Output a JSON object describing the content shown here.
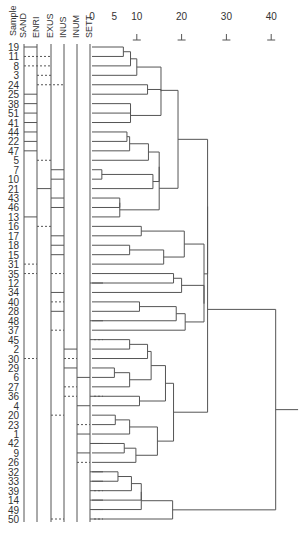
{
  "chart_data": {
    "type": "dendrogram",
    "title": "",
    "column_headers": [
      "Sample",
      "SAND",
      "ENRI",
      "EXUS",
      "INUS",
      "INUM",
      "SETT"
    ],
    "axis": {
      "ticks": [
        0,
        5,
        10,
        20,
        30,
        40
      ],
      "marked_ticks": [
        10,
        20,
        30,
        40
      ],
      "range": [
        0,
        45
      ]
    },
    "leaves": [
      "19",
      "11",
      "8",
      "3",
      "24",
      "25",
      "38",
      "51",
      "41",
      "44",
      "22",
      "47",
      "5",
      "7",
      "10",
      "21",
      "43",
      "46",
      "13",
      "16",
      "17",
      "18",
      "15",
      "31",
      "35",
      "12",
      "34",
      "40",
      "28",
      "48",
      "37",
      "45",
      "2",
      "30",
      "29",
      "6",
      "27",
      "36",
      "4",
      "20",
      "23",
      "1",
      "42",
      "9",
      "26",
      "32",
      "33",
      "39",
      "14",
      "49",
      "50"
    ],
    "merges": [
      {
        "a": "L0",
        "b": "L1",
        "h": 7.0,
        "id": "m0"
      },
      {
        "a": "m0",
        "b": "L2",
        "h": 8.6,
        "id": "m1"
      },
      {
        "a": "m1",
        "b": "L3",
        "h": 10.0,
        "id": "m2"
      },
      {
        "a": "L4",
        "b": "L5",
        "h": 12.4,
        "id": "m3"
      },
      {
        "a": "L6",
        "b": "L7",
        "h": 8.6,
        "id": "m4"
      },
      {
        "a": "m4",
        "b": "L8",
        "h": 8.6,
        "id": "m5"
      },
      {
        "a": "m2",
        "b": "m5",
        "h": 15.4,
        "id": "m6_pre"
      },
      {
        "a": "m6_pre",
        "b": "m3",
        "h": 15.4,
        "id": "m6"
      },
      {
        "a": "L9",
        "b": "L10",
        "h": 7.8,
        "id": "m7"
      },
      {
        "a": "m7",
        "b": "L11",
        "h": 8.4,
        "id": "m8"
      },
      {
        "a": "m8",
        "b": "L12",
        "h": 12.6,
        "id": "m9"
      },
      {
        "a": "L13",
        "b": "L14",
        "h": 2.2,
        "id": "m10"
      },
      {
        "a": "m10",
        "b": "L15",
        "h": 13.6,
        "id": "m11"
      },
      {
        "a": "m11",
        "b": "m9",
        "h": 15.0,
        "id": "m12"
      },
      {
        "a": "L16",
        "b": "L17",
        "h": 6.2,
        "id": "m13"
      },
      {
        "a": "m13",
        "b": "L18",
        "h": 6.2,
        "id": "m14"
      },
      {
        "a": "m12",
        "b": "m14",
        "h": 15.0,
        "id": "m15"
      },
      {
        "a": "m6",
        "b": "m15",
        "h": 19.2,
        "id": "m16"
      },
      {
        "a": "L19",
        "b": "L20",
        "h": 11.0,
        "id": "m17"
      },
      {
        "a": "L21",
        "b": "L22",
        "h": 8.4,
        "id": "m18"
      },
      {
        "a": "m18",
        "b": "L23",
        "h": 16.0,
        "id": "m19"
      },
      {
        "a": "m17",
        "b": "m19",
        "h": 20.6,
        "id": "m20"
      },
      {
        "a": "L24",
        "b": "L25",
        "h": 18.2,
        "id": "m21"
      },
      {
        "a": "m21",
        "b": "L26",
        "h": 20.0,
        "id": "m22"
      },
      {
        "a": "L27",
        "b": "L28",
        "h": 10.6,
        "id": "m23"
      },
      {
        "a": "m23",
        "b": "L29",
        "h": 18.8,
        "id": "m24"
      },
      {
        "a": "m24",
        "b": "L30",
        "h": 20.8,
        "id": "m25"
      },
      {
        "a": "m22",
        "b": "m25",
        "h": 25.0,
        "id": "m26"
      },
      {
        "a": "m20",
        "b": "m26",
        "h": 25.0,
        "id": "m27"
      },
      {
        "a": "m16",
        "b": "m27",
        "h": 25.8,
        "id": "m28"
      },
      {
        "a": "L31",
        "b": "L32",
        "h": 8.4,
        "id": "m29"
      },
      {
        "a": "m29",
        "b": "L33",
        "h": 12.4,
        "id": "m30"
      },
      {
        "a": "L34",
        "b": "L35",
        "h": 5.0,
        "id": "m31"
      },
      {
        "a": "m31",
        "b": "L36",
        "h": 8.4,
        "id": "m32"
      },
      {
        "a": "m30",
        "b": "m32",
        "h": 13.2,
        "id": "m33"
      },
      {
        "a": "L37",
        "b": "L38",
        "h": 10.6,
        "id": "m34"
      },
      {
        "a": "m33",
        "b": "m34",
        "h": 16.4,
        "id": "m35"
      },
      {
        "a": "L39",
        "b": "L40",
        "h": 5.2,
        "id": "m36"
      },
      {
        "a": "m36",
        "b": "L41",
        "h": 8.4,
        "id": "m37"
      },
      {
        "a": "L42",
        "b": "L43",
        "h": 7.2,
        "id": "m38"
      },
      {
        "a": "m38",
        "b": "L44",
        "h": 9.8,
        "id": "m39"
      },
      {
        "a": "m37",
        "b": "m39",
        "h": 14.6,
        "id": "m40"
      },
      {
        "a": "m35",
        "b": "m40",
        "h": 18.2,
        "id": "m41"
      },
      {
        "a": "m41",
        "b": "m28",
        "h": 25.8,
        "id": "m42_pre"
      },
      {
        "a": "L45",
        "b": "L46",
        "h": 5.8,
        "id": "m43"
      },
      {
        "a": "m43",
        "b": "L47",
        "h": 8.8,
        "id": "m44"
      },
      {
        "a": "m44",
        "b": "L48",
        "h": 11.0,
        "id": "m45"
      },
      {
        "a": "m45",
        "b": "L49",
        "h": 11.0,
        "id": "m46"
      },
      {
        "a": "m46",
        "b": "L50",
        "h": 18.0,
        "id": "m47"
      },
      {
        "a": "m42_pre",
        "b": "m47",
        "h": 41.0,
        "id": "root"
      }
    ],
    "root_tail_to": 46.0,
    "bars": [
      {
        "row": 0,
        "col": 0,
        "style": "solid"
      },
      {
        "row": 1,
        "col": 0,
        "style": "dash",
        "to": 2
      },
      {
        "row": 2,
        "col": 0,
        "style": "dash",
        "to": 2
      },
      {
        "row": 3,
        "col": 1,
        "style": "dash",
        "to": 2
      },
      {
        "row": 4,
        "col": 1,
        "style": "dash",
        "to": 3
      },
      {
        "row": 5,
        "col": 0,
        "style": "solid"
      },
      {
        "row": 6,
        "col": 0,
        "style": "solid"
      },
      {
        "row": 7,
        "col": 0,
        "style": "solid"
      },
      {
        "row": 8,
        "col": 0,
        "style": "solid"
      },
      {
        "row": 9,
        "col": 0,
        "style": "solid"
      },
      {
        "row": 10,
        "col": 0,
        "style": "solid"
      },
      {
        "row": 11,
        "col": 0,
        "style": "solid"
      },
      {
        "row": 12,
        "col": 1,
        "style": "dash",
        "to": 2
      },
      {
        "row": 13,
        "col": 2,
        "style": "solid"
      },
      {
        "row": 14,
        "col": 2,
        "style": "solid"
      },
      {
        "row": 15,
        "col": 1,
        "style": "solid"
      },
      {
        "row": 16,
        "col": 2,
        "style": "solid"
      },
      {
        "row": 17,
        "col": 2,
        "style": "solid"
      },
      {
        "row": 18,
        "col": 0,
        "style": "solid"
      },
      {
        "row": 19,
        "col": 1,
        "style": "dash",
        "to": 2
      },
      {
        "row": 20,
        "col": 2,
        "style": "solid"
      },
      {
        "row": 21,
        "col": 2,
        "style": "solid"
      },
      {
        "row": 22,
        "col": 2,
        "style": "solid"
      },
      {
        "row": 23,
        "col": 0,
        "style": "dash",
        "to": 1
      },
      {
        "row": 24,
        "col": 0,
        "style": "dash",
        "to": 1
      },
      {
        "row": 24,
        "col": 2,
        "style": "dash",
        "to": 3
      },
      {
        "row": 25,
        "col": 5,
        "style": "solid"
      },
      {
        "row": 26,
        "col": 2,
        "style": "solid"
      },
      {
        "row": 27,
        "col": 2,
        "style": "dash",
        "to": 3
      },
      {
        "row": 28,
        "col": 2,
        "style": "solid"
      },
      {
        "row": 29,
        "col": 5,
        "style": "solid"
      },
      {
        "row": 30,
        "col": 2,
        "style": "dash",
        "to": 3
      },
      {
        "row": 31,
        "col": 5,
        "style": "dash",
        "to": 6
      },
      {
        "row": 32,
        "col": 3,
        "style": "solid"
      },
      {
        "row": 33,
        "col": 0,
        "style": "dash",
        "to": 1
      },
      {
        "row": 33,
        "col": 3,
        "style": "dash",
        "to": 4
      },
      {
        "row": 34,
        "col": 3,
        "style": "solid"
      },
      {
        "row": 35,
        "col": 4,
        "style": "solid"
      },
      {
        "row": 36,
        "col": 3,
        "style": "dash",
        "to": 4
      },
      {
        "row": 37,
        "col": 3,
        "style": "dash",
        "to": 4
      },
      {
        "row": 37,
        "col": 5,
        "style": "dash",
        "to": 6
      },
      {
        "row": 38,
        "col": 4,
        "style": "solid"
      },
      {
        "row": 39,
        "col": 2,
        "style": "dash",
        "to": 3
      },
      {
        "row": 40,
        "col": 4,
        "style": "dash",
        "to": 5
      },
      {
        "row": 41,
        "col": 4,
        "style": "solid"
      },
      {
        "row": 42,
        "col": 5,
        "style": "solid"
      },
      {
        "row": 43,
        "col": 4,
        "style": "solid"
      },
      {
        "row": 44,
        "col": 4,
        "style": "dash",
        "to": 5
      },
      {
        "row": 45,
        "col": 5,
        "style": "solid"
      },
      {
        "row": 46,
        "col": 5,
        "style": "solid"
      },
      {
        "row": 47,
        "col": 5,
        "style": "dash",
        "to": 6
      },
      {
        "row": 48,
        "col": 5,
        "style": "solid"
      },
      {
        "row": 49,
        "col": 5,
        "style": "solid"
      },
      {
        "row": 50,
        "col": 2,
        "style": "dash",
        "to": 3
      },
      {
        "row": 50,
        "col": 5,
        "style": "dash",
        "to": 6
      }
    ]
  },
  "layout": {
    "row_y0": 47,
    "row_step": 9.44,
    "x0": 92,
    "px_per_unit": 4.48,
    "column_x": [
      24,
      37,
      51,
      64,
      77,
      90
    ],
    "line_color": "#555555"
  },
  "header": {
    "sample": "Sample",
    "columns": [
      "SAND",
      "ENRI",
      "EXUS",
      "INUS",
      "INUM",
      "SETT"
    ],
    "tick_labels": [
      "0",
      "5",
      "10",
      "20",
      "30",
      "40"
    ]
  }
}
